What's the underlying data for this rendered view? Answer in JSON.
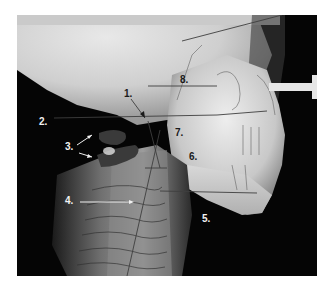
{
  "figure": {
    "labels": [
      {
        "id": "1",
        "text": "1."
      },
      {
        "id": "2",
        "text": "2."
      },
      {
        "id": "3",
        "text": "3."
      },
      {
        "id": "4",
        "text": "4."
      },
      {
        "id": "5",
        "text": "5."
      },
      {
        "id": "6",
        "text": "6."
      },
      {
        "id": "7",
        "text": "7."
      },
      {
        "id": "8",
        "text": "8."
      }
    ]
  }
}
